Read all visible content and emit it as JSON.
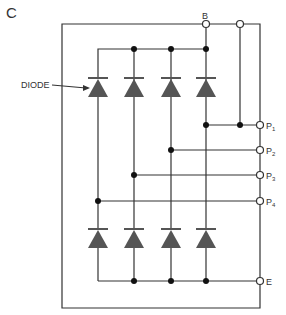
{
  "figure": {
    "panel_label": "C",
    "callout_label": "DIODE",
    "terminals": {
      "B": "B",
      "P1": "P",
      "P1_sub": "1",
      "P2": "P",
      "P2_sub": "2",
      "P3": "P",
      "P3_sub": "3",
      "P4": "P",
      "P4_sub": "4",
      "E": "E"
    },
    "colors": {
      "wire": "#333333",
      "diode": "#555555",
      "terminal_fill": "#ffffff"
    },
    "diode_columns": 4,
    "diode_rows": 2
  }
}
